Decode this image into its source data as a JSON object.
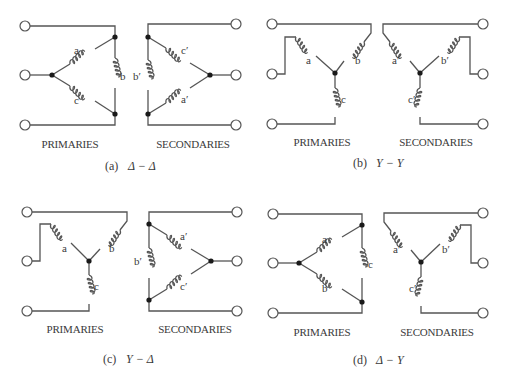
{
  "figure": {
    "colors": {
      "wire": "#555555",
      "node": "#1a1a1a",
      "text": "#3a3a3a",
      "background": "#ffffff"
    },
    "panels": [
      {
        "id": "a",
        "caption_prefix": "(a)",
        "caption_formula": "Δ − Δ",
        "primary_connection": "delta",
        "secondary_connection": "delta",
        "primaries_label": "PRIMARIES",
        "secondaries_label": "SECONDARIES",
        "primary_coils": [
          "a",
          "b",
          "c"
        ],
        "secondary_coils": [
          "c′",
          "b′",
          "a′"
        ]
      },
      {
        "id": "b",
        "caption_prefix": "(b)",
        "caption_formula": "Y − Y",
        "primary_connection": "wye",
        "secondary_connection": "wye",
        "primaries_label": "PRIMARIES",
        "secondaries_label": "SECONDARIES",
        "primary_coils": [
          "a",
          "b",
          "c"
        ],
        "secondary_coils": [
          "a′",
          "b′",
          "c′"
        ]
      },
      {
        "id": "c",
        "caption_prefix": "(c)",
        "caption_formula": "Y − Δ",
        "primary_connection": "wye",
        "secondary_connection": "delta",
        "primaries_label": "PRIMARIES",
        "secondaries_label": "SECONDARIES",
        "primary_coils": [
          "a",
          "b",
          "c"
        ],
        "secondary_coils": [
          "a′",
          "b′",
          "c′"
        ]
      },
      {
        "id": "d",
        "caption_prefix": "(d)",
        "caption_formula": "Δ − Y",
        "primary_connection": "delta",
        "secondary_connection": "wye",
        "primaries_label": "PRIMARIES",
        "secondaries_label": "SECONDARIES",
        "primary_coils": [
          "a",
          "b",
          "c"
        ],
        "secondary_coils": [
          "a′",
          "b′",
          "c′"
        ]
      }
    ]
  }
}
